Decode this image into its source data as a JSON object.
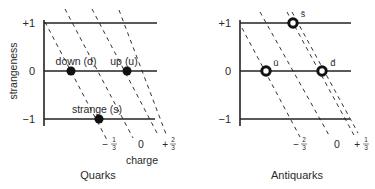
{
  "quarks": {
    "title": "Quarks",
    "y_axis_label": "strangeness",
    "x_axis_label": "charge",
    "y_ticks": [
      "+1",
      "0",
      "−1"
    ],
    "charge_ticks": [
      {
        "sign": "−",
        "num": "1",
        "den": "3"
      },
      {
        "sign": "",
        "num": "0",
        "den": ""
      },
      {
        "sign": "+",
        "num": "2",
        "den": "3"
      }
    ],
    "particles": [
      {
        "label": "down (d)",
        "strangeness": 0,
        "charge": "-1/3"
      },
      {
        "label": "up (u)",
        "strangeness": 0,
        "charge": "+2/3"
      },
      {
        "label": "strange (s)",
        "strangeness": -1,
        "charge": "-1/3"
      }
    ]
  },
  "antiquarks": {
    "title": "Antiquarks",
    "y_ticks": [
      "+1",
      "0",
      "−1"
    ],
    "charge_ticks": [
      {
        "sign": "−",
        "num": "2",
        "den": "3"
      },
      {
        "sign": "",
        "num": "0",
        "den": ""
      },
      {
        "sign": "+",
        "num": "1",
        "den": "3"
      }
    ],
    "particles": [
      {
        "label": "s̄",
        "strangeness": 1,
        "charge": "+1/3"
      },
      {
        "label": "ū",
        "strangeness": 0,
        "charge": "-2/3"
      },
      {
        "label": "d̄",
        "strangeness": 0,
        "charge": "+1/3"
      }
    ]
  }
}
